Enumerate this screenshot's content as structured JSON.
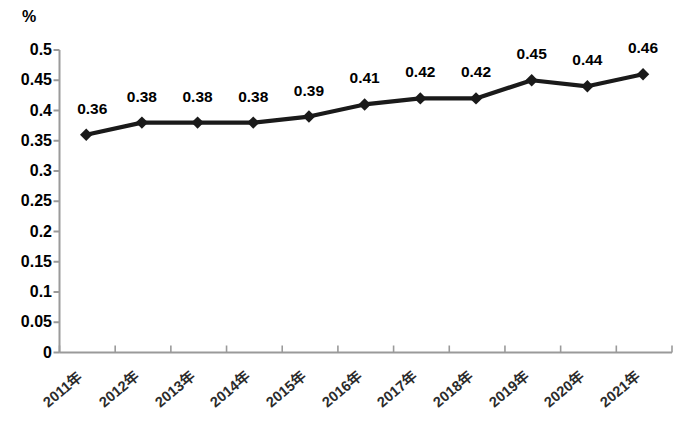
{
  "chart_data": {
    "type": "line",
    "title": "",
    "subtitle": "",
    "xlabel": "",
    "ylabel": "%",
    "unit_label": "%",
    "categories": [
      "2011年",
      "2012年",
      "2013年",
      "2014年",
      "2015年",
      "2016年",
      "2017年",
      "2018年",
      "2019年",
      "2020年",
      "2021年"
    ],
    "values": [
      0.36,
      0.38,
      0.38,
      0.38,
      0.39,
      0.41,
      0.42,
      0.42,
      0.45,
      0.44,
      0.46
    ],
    "data_labels": [
      "0.36",
      "0.38",
      "0.38",
      "0.38",
      "0.39",
      "0.41",
      "0.42",
      "0.42",
      "0.45",
      "0.44",
      "0.46"
    ],
    "ylim": [
      0,
      0.5
    ],
    "ytick_values": [
      0.5,
      0.45,
      0.4,
      0.35,
      0.3,
      0.25,
      0.2,
      0.15,
      0.1,
      0.05,
      0
    ],
    "ytick_labels": [
      "0.5",
      "0.45",
      "0.4",
      "0.35",
      "0.3",
      "0.25",
      "0.2",
      "0.15",
      "0.1",
      "0.05",
      "0"
    ],
    "grid": false,
    "legend": false,
    "legend_position": "none",
    "series": [
      {
        "name": "",
        "values": [
          0.36,
          0.38,
          0.38,
          0.38,
          0.39,
          0.41,
          0.42,
          0.42,
          0.45,
          0.44,
          0.46
        ],
        "line_color": "#1a1a1a",
        "marker": "diamond",
        "marker_color": "#1a1a1a"
      }
    ],
    "colors": {
      "line": "#1a1a1a",
      "marker": "#1a1a1a",
      "axis": "#9a9a9a",
      "text": "#000000",
      "background": "#ffffff"
    }
  }
}
